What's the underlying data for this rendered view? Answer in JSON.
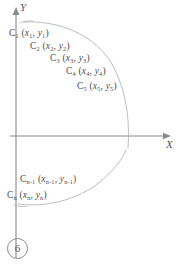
{
  "figure": {
    "number": "6",
    "background_color": "#ffffff",
    "ink_color": "#4d4d4d",
    "axis_color": "#8a8a8a"
  },
  "axes": {
    "y_label": "Y",
    "x_label": "X",
    "origin": {
      "x": 16,
      "y": 136
    },
    "y_axis": {
      "from_y": 258,
      "to_y": 10,
      "arrow": "up"
    },
    "x_axis": {
      "from_x": 16,
      "to_x": 170,
      "arrow": "right"
    }
  },
  "curves": [
    {
      "name": "upper-branch",
      "description": "faint hand-drawn arc from upper-left bowing right and down across the X axis",
      "path": "M 24 22 C 60 20, 96 36, 112 64 C 126 90, 130 118, 128 148"
    },
    {
      "name": "lower-branch",
      "description": "faint hand-drawn arc rising from lower-left to the right toward the X axis",
      "path": "M 18 204 C 44 208, 78 200, 100 182 C 114 170, 122 160, 126 150"
    }
  ],
  "points": [
    {
      "id": "c1",
      "label": "C",
      "index": "1",
      "x_var": "x",
      "x_index": "1",
      "y_var": "y",
      "y_index": "1"
    },
    {
      "id": "c2",
      "label": "C",
      "index": "2",
      "x_var": "x",
      "x_index": "2",
      "y_var": "y",
      "y_index": "2"
    },
    {
      "id": "c3",
      "label": "C",
      "index": "3",
      "x_var": "x",
      "x_index": "3",
      "y_var": "y",
      "y_index": "3"
    },
    {
      "id": "c4",
      "label": "C",
      "index": "4",
      "x_var": "x",
      "x_index": "4",
      "y_var": "y",
      "y_index": "4"
    },
    {
      "id": "c5",
      "label": "C",
      "index": "5",
      "x_var": "x",
      "x_index": "5",
      "y_var": "y",
      "y_index": "5"
    },
    {
      "id": "cn1",
      "label": "C",
      "index": "n-1",
      "x_var": "x",
      "x_index": "n-1",
      "y_var": "y",
      "y_index": "n-1"
    },
    {
      "id": "cn",
      "label": "C",
      "index": "n",
      "x_var": "x",
      "x_index": "n",
      "y_var": "y",
      "y_index": "n"
    }
  ],
  "labels": {
    "c1": {
      "name": "C",
      "sub": "1",
      "open": " (",
      "xv": "x",
      "xs": "1",
      "comma": ", ",
      "yv": "y",
      "ys": "1",
      "close": ")"
    },
    "c2": {
      "name": "C",
      "sub": "2",
      "open": " (",
      "xv": "x",
      "xs": "2",
      "comma": ", ",
      "yv": "y",
      "ys": "2",
      "close": ")"
    },
    "c3": {
      "name": "C",
      "sub": "3",
      "open": " (",
      "xv": "x",
      "xs": "3",
      "comma": ", ",
      "yv": "y",
      "ys": "3",
      "close": ")"
    },
    "c4": {
      "name": "C",
      "sub": "4",
      "open": " (",
      "xv": "x",
      "xs": "4",
      "comma": ", ",
      "yv": "y",
      "ys": "4",
      "close": ")"
    },
    "c5": {
      "name": "C",
      "sub": "5",
      "open": " (",
      "xv": "x",
      "xs": "5",
      "comma": ", ",
      "yv": "y",
      "ys": "5",
      "close": ")"
    },
    "cn1": {
      "name": "C",
      "sub": "n-1",
      "open": " (",
      "xv": "x",
      "xs": "n-1",
      "comma": ", ",
      "yv": "y",
      "ys": "n-1",
      "close": ")"
    },
    "cn": {
      "name": "C",
      "sub": "n",
      "open": " (",
      "xv": "x",
      "xs": "n",
      "comma": ", ",
      "yv": "y",
      "ys": "n",
      "close": ")"
    }
  }
}
